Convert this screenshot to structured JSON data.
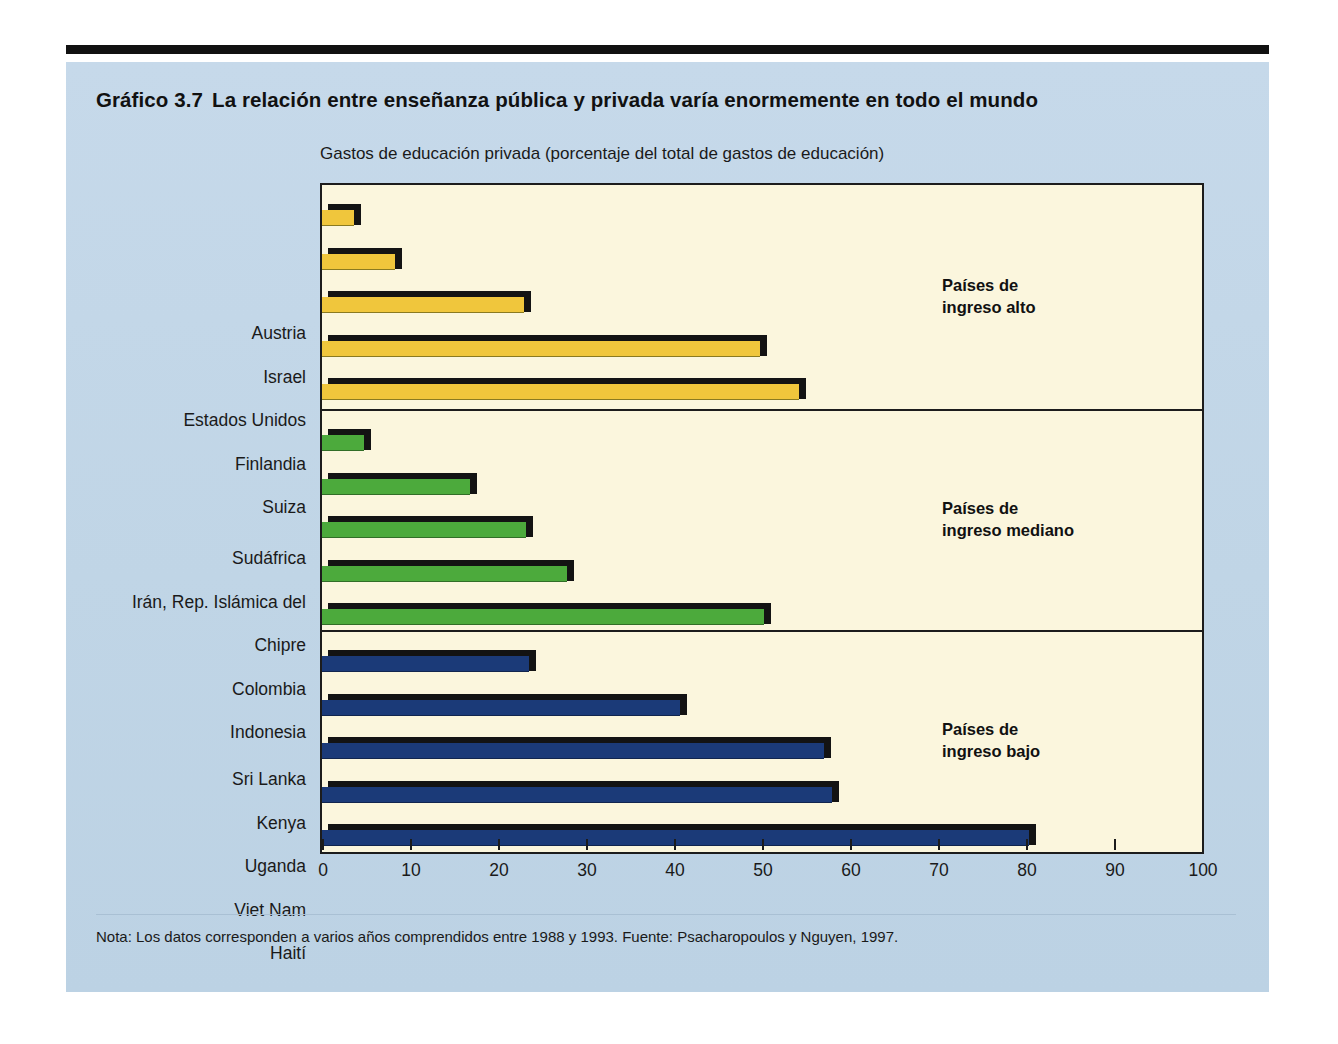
{
  "figure": {
    "number": "Gráfico 3.7",
    "title": "La relación entre enseñanza pública y privada varía enormemente en todo el mundo",
    "subtitle": "Gastos de educación privada (porcentaje del total de gastos de educación)",
    "footnote": "Nota: Los datos corresponden a varios años comprendidos entre 1988 y 1993. Fuente: Psacharopoulos y Nguyen, 1997."
  },
  "colors": {
    "panel_background": "#c3d7e8",
    "plot_background": "#fbf6dd",
    "high_income_bar": "#f0c63c",
    "middle_income_bar": "#4caa3c",
    "low_income_bar": "#1b3a78",
    "bar_shadow": "#131313",
    "axis": "#1c1c1c"
  },
  "chart_data": {
    "type": "bar",
    "orientation": "horizontal",
    "subtitle": "Gastos de educación privada (porcentaje del total de gastos de educación)",
    "xlabel": "",
    "ylabel": "",
    "xlim": [
      0,
      100
    ],
    "xticks": [
      0,
      10,
      20,
      30,
      40,
      50,
      60,
      70,
      80,
      90,
      100
    ],
    "xtick_labels": [
      "0",
      "10",
      "20",
      "30",
      "40",
      "50",
      "60",
      "70",
      "80",
      "90",
      "100"
    ],
    "grid": false,
    "legend": "none",
    "groups": [
      {
        "name": "Países de ingreso alto",
        "annotation_line1": "Países de",
        "annotation_line2": "ingreso alto",
        "color": "#f0c63c",
        "categories": [
          "Austria",
          "Israel",
          "Estados Unidos",
          "Finlandia",
          "Suiza"
        ],
        "values": [
          3.6,
          8.3,
          23.0,
          49.8,
          54.2
        ]
      },
      {
        "name": "Países de ingreso mediano",
        "annotation_line1": "Países de",
        "annotation_line2": "ingreso mediano",
        "color": "#4caa3c",
        "categories": [
          "Sudáfrica",
          "Irán, Rep. Islámica del",
          "Chipre",
          "Colombia",
          "Indonesia"
        ],
        "values": [
          4.8,
          16.8,
          23.2,
          27.8,
          50.2
        ]
      },
      {
        "name": "Países de ingreso bajo",
        "annotation_line1": "Países de",
        "annotation_line2": "ingreso bajo",
        "color": "#1b3a78",
        "categories": [
          "Sri Lanka",
          "Kenya",
          "Uganda",
          "Viet Nam",
          "Haití"
        ],
        "values": [
          23.5,
          40.7,
          57.0,
          58.0,
          80.3
        ]
      }
    ]
  }
}
